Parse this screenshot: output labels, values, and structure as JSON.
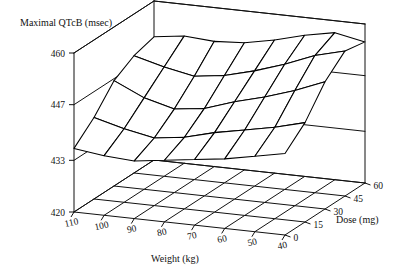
{
  "figure": {
    "title": "Maximal QTcB (msec)",
    "background_color": "#ffffff",
    "line_color": "#000000",
    "text_color": "#111111"
  },
  "axes": {
    "z": {
      "label": "Maximal QTcB (msec)",
      "ticks": [
        "420",
        "433",
        "447",
        "460"
      ],
      "tick_values": [
        420,
        433,
        447,
        460
      ],
      "min": 420,
      "max": 460
    },
    "x": {
      "label": "Weight (kg)",
      "ticks": [
        "110",
        "100",
        "90",
        "80",
        "70",
        "60",
        "50",
        "40"
      ],
      "tick_values": [
        110,
        100,
        90,
        80,
        70,
        60,
        50,
        40
      ],
      "min": 40,
      "max": 110
    },
    "y": {
      "label": "Dose (mg)",
      "ticks": [
        "0",
        "15",
        "30",
        "45",
        "60"
      ],
      "tick_values": [
        0,
        15,
        30,
        45,
        60
      ],
      "min": 0,
      "max": 60
    }
  },
  "chart_data": {
    "type": "surface",
    "title": "Maximal QTcB (msec)",
    "xlabel": "Weight (kg)",
    "ylabel": "Dose (mg)",
    "zlabel": "Maximal QTcB (msec)",
    "xlim": [
      40,
      110
    ],
    "ylim": [
      0,
      60
    ],
    "zlim": [
      420,
      460
    ],
    "grid": true,
    "legend": "none",
    "x": [
      110,
      100,
      90,
      80,
      70,
      60,
      50,
      40
    ],
    "y": [
      0,
      15,
      30,
      45,
      60
    ],
    "z_note": "rows correspond to Dose values y (0,15,30,45,60); columns correspond to Weight values x (110..40)",
    "z": [
      [
        436.0,
        435.0,
        434.5,
        435.5,
        436.5,
        437.5,
        439.0,
        440.5
      ],
      [
        440.5,
        438.5,
        437.0,
        438.0,
        440.0,
        441.5,
        443.0,
        445.0
      ],
      [
        446.5,
        443.0,
        441.0,
        442.0,
        444.5,
        446.5,
        449.0,
        452.0
      ],
      [
        449.5,
        447.5,
        446.0,
        447.0,
        449.0,
        451.5,
        454.5,
        456.5
      ],
      [
        451.0,
        452.0,
        451.5,
        452.0,
        453.5,
        455.5,
        457.0,
        455.5
      ]
    ]
  }
}
